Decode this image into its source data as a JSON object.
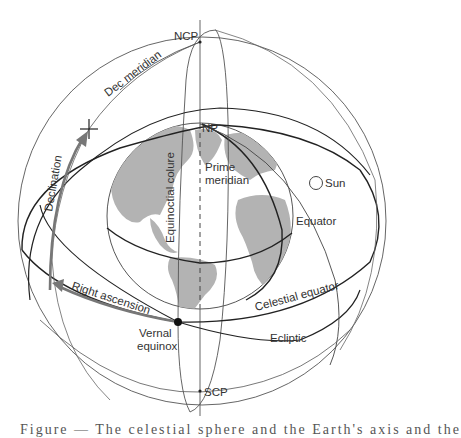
{
  "figure": {
    "labels": {
      "ncp": "NCP",
      "scp": "SCP",
      "np": "NP",
      "dec_meridian": "Dec meridian",
      "declination": "Declination",
      "right_ascension": "Right ascension",
      "vernal_equinox_line1": "Vernal",
      "vernal_equinox_line2": "equinox",
      "equinoctial_colure": "Equinoctial colure",
      "prime_meridian_line1": "Prime",
      "prime_meridian_line2": "meridian",
      "sun": "Sun",
      "equator": "Equator",
      "celestial_equator": "Celestial equator",
      "ecliptic": "Ecliptic"
    },
    "caption": "Figure — The celestial sphere and the Earth's axis and the"
  },
  "colors": {
    "line": "#333333",
    "thin_line": "#666666",
    "arrow": "#777777",
    "land": "#b3b3b3",
    "background": "#ffffff"
  }
}
